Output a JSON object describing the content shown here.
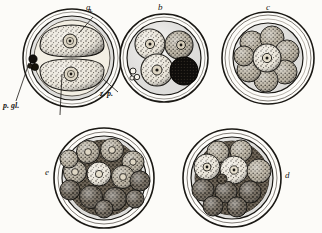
{
  "figure": {
    "background_color": "#fcfbf8",
    "ink_color": "#1a1814"
  },
  "stages": [
    {
      "id": "a",
      "label": "a",
      "label_x": 86,
      "label_y": 5,
      "cx": 72,
      "cy": 58,
      "outer_r": 49,
      "zona_r": 42,
      "inner_r": 37,
      "description": "two-cell stage with two blastomeres and polar globules",
      "cell_count": 2
    },
    {
      "id": "b",
      "label": "b",
      "label_x": 158,
      "label_y": 5,
      "cx": 164,
      "cy": 58,
      "outer_r": 44,
      "zona_r": 38,
      "inner_r": 33,
      "description": "four-cell stage with one darkly shaded blastomere",
      "cell_count": 4
    },
    {
      "id": "c",
      "label": "c",
      "label_x": 266,
      "label_y": 5,
      "cx": 268,
      "cy": 58,
      "outer_r": 46,
      "zona_r": 40,
      "inner_r": 35,
      "description": "eight-cell morula",
      "cell_count": 8
    },
    {
      "id": "e",
      "label": "e",
      "label_x": 45,
      "label_y": 168,
      "cx": 104,
      "cy": 178,
      "outer_r": 50,
      "zona_r": 44,
      "inner_r": 39,
      "description": "multicellular morula, many blastomeres",
      "cell_count": 13
    },
    {
      "id": "d",
      "label": "d",
      "label_x": 285,
      "label_y": 171,
      "cx": 232,
      "cy": 178,
      "outer_r": 49,
      "zona_r": 43,
      "inner_r": 38,
      "description": "morula with coarse blastomeres",
      "cell_count": 11
    }
  ],
  "annotations": [
    {
      "id": "nucleus",
      "text": "n.",
      "label_x": 88,
      "label_y": 9,
      "leader_from_x": 93,
      "leader_from_y": 17,
      "leader_to_x": 79,
      "leader_to_y": 33
    },
    {
      "id": "zona-pellucida",
      "text": "z. p.",
      "label_x": 100,
      "label_y": 94,
      "leader_from_x": 118,
      "leader_from_y": 94,
      "leader_to_x": 103,
      "leader_to_y": 79
    },
    {
      "id": "polar-globules",
      "text": "p. gl.",
      "label_x": 3,
      "label_y": 106,
      "leader_from_x": 16,
      "leader_from_y": 103,
      "leader_to_x": 29,
      "leader_to_y": 63
    },
    {
      "id": "blastomere",
      "text": "",
      "label_x": 60,
      "label_y": 116,
      "leader_from_x": 60,
      "leader_from_y": 115,
      "leader_to_x": 62,
      "leader_to_y": 74
    }
  ]
}
